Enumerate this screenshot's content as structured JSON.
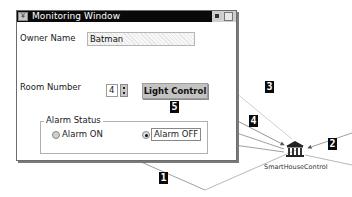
{
  "window": {
    "title": "Monitoring Window",
    "menu_glyph": "¥",
    "owner": {
      "label": "Owner Name",
      "value": "Batman"
    },
    "room": {
      "label": "Room Number",
      "value": "4"
    },
    "light_button": "Light Control",
    "alarm": {
      "group_label": "Alarm Status",
      "options": [
        {
          "label": "Alarm ON",
          "selected": false
        },
        {
          "label": "Alarm OFF",
          "selected": true
        }
      ]
    }
  },
  "diagram": {
    "node": {
      "label": "SmartHouseControl",
      "icon": "building-columns-icon"
    },
    "badges": [
      "1",
      "2",
      "3",
      "4",
      "5"
    ]
  }
}
